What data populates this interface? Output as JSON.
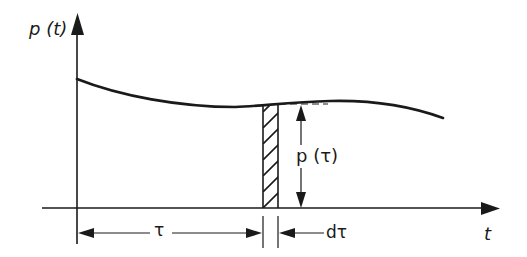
{
  "diagram": {
    "type": "function-plot-with-infinitesimal-strip",
    "colors": {
      "line": "#1a1a1a",
      "background": "#ffffff"
    },
    "axes": {
      "y_label": "p (t)",
      "x_label": "t"
    },
    "curve": {
      "name": "p(t)",
      "description": "smooth curve starting high at t=0, dipping slightly, rising, then falling toward the right"
    },
    "strip": {
      "description": "hatched vertical strip of width dτ under the curve at t=τ",
      "height_label": "p (τ)"
    },
    "dimensions": {
      "tau_label": "τ",
      "dtau_label": "dτ"
    }
  }
}
